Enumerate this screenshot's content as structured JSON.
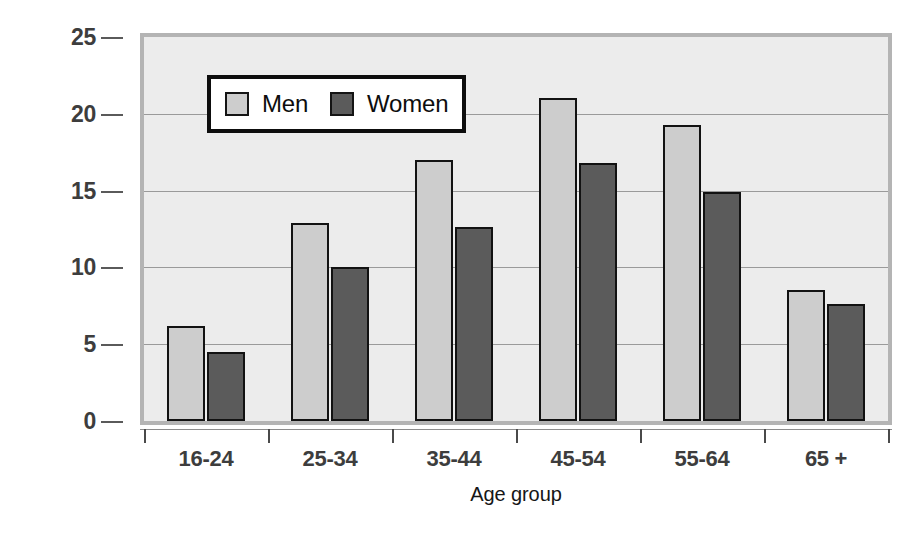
{
  "chart_data": {
    "type": "bar",
    "title": "",
    "xlabel": "Age group",
    "ylabel": "Percentage of workers unionized",
    "ylabel_line1": "Percentage of workers",
    "ylabel_line2": "unionized",
    "categories": [
      "16-24",
      "25-34",
      "35-44",
      "45-54",
      "55-64",
      "65 +"
    ],
    "series": [
      {
        "name": "Men",
        "values": [
          6.2,
          12.9,
          17.0,
          21.0,
          19.3,
          8.5
        ]
      },
      {
        "name": "Women",
        "values": [
          4.5,
          10.0,
          12.6,
          16.8,
          14.9,
          7.6
        ]
      }
    ],
    "ylim": [
      0,
      25
    ],
    "yticks": [
      0,
      5,
      10,
      15,
      20,
      25
    ],
    "ytick_labels": [
      "0",
      "5",
      "10",
      "15",
      "20",
      "25"
    ],
    "grid": true,
    "legend_position": "upper-left-inside",
    "colors": {
      "men": "#cdcdcd",
      "women": "#5b5b5b",
      "bar_outline": "#121212",
      "plot_background": "#ececec",
      "plot_border": "#b4b4b4",
      "gridline": "#9a9a9a",
      "axis_text": "#3d3d3d",
      "title_text": "#161616",
      "legend_background": "#ffffff",
      "legend_border": "#0d0d0d",
      "page_background": "#ffffff"
    }
  },
  "legend": {
    "entries": [
      {
        "label": "Men",
        "swatch": "men-swatch"
      },
      {
        "label": "Women",
        "swatch": "women-swatch"
      }
    ]
  }
}
